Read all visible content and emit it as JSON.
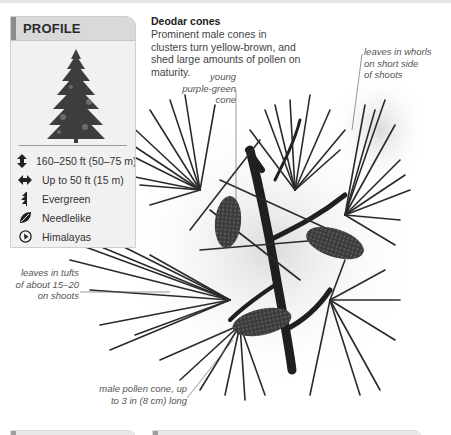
{
  "profile": {
    "title": "PROFILE",
    "tree_image": "deodar-tree-silhouette",
    "facts": [
      {
        "icon": "height-icon",
        "text": "160–250 ft (50–75 m)"
      },
      {
        "icon": "spread-icon",
        "text": "Up to 50 ft (15 m)"
      },
      {
        "icon": "evergreen-icon",
        "text": "Evergreen"
      },
      {
        "icon": "leaf-icon",
        "text": "Needlelike"
      },
      {
        "icon": "location-icon",
        "text": "Himalayas"
      }
    ]
  },
  "caption": {
    "title": "Deodar cones",
    "body": "Prominent male cones in clusters turn yellow-brown, and shed large amounts of pollen on maturity."
  },
  "annotations": {
    "young_cone": [
      "young",
      "purple-green cone"
    ],
    "whorls": [
      "leaves in whorls",
      "on short side",
      "of shoots"
    ],
    "tufts": [
      "leaves in tufts",
      "of about 15–20",
      "on shoots"
    ],
    "pollen_cone": [
      "male pollen cone, up",
      "to 3 in (8 cm) long"
    ]
  },
  "illustration": {
    "subject": "deodar-branch-with-cones",
    "colors": {
      "needle": "#2a2a2a",
      "branch": "#1f1f1f",
      "cone": "#3c3c3c",
      "leader_line": "#6a6a6a"
    }
  },
  "bottom_panels": [
    {
      "name": "left-panel"
    },
    {
      "name": "right-panel"
    }
  ]
}
